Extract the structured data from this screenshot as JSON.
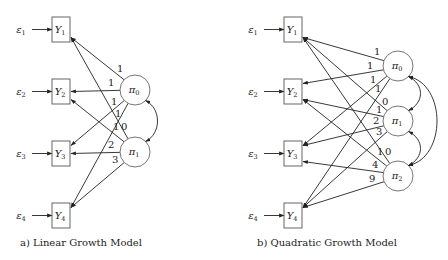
{
  "panels": [
    {
      "id": "linear",
      "caption": "a) Linear Growth Model",
      "caption_pos": [
        20,
        246
      ],
      "observed": [
        {
          "name": "Y",
          "sub": "1",
          "error": "ε",
          "error_sub": "1",
          "x": 52,
          "y": 17
        },
        {
          "name": "Y",
          "sub": "2",
          "error": "ε",
          "error_sub": "2",
          "x": 52,
          "y": 79
        },
        {
          "name": "Y",
          "sub": "3",
          "error": "ε",
          "error_sub": "3",
          "x": 52,
          "y": 141
        },
        {
          "name": "Y",
          "sub": "4",
          "error": "ε",
          "error_sub": "4",
          "x": 52,
          "y": 203
        }
      ],
      "latent": [
        {
          "name": "π",
          "sub": "0",
          "cx": 135,
          "cy": 90
        },
        {
          "name": "π",
          "sub": "1",
          "cx": 135,
          "cy": 152
        }
      ],
      "loadings": [
        {
          "from": 0,
          "to": 0,
          "label": "1",
          "lx": 117,
          "ly": 72
        },
        {
          "from": 0,
          "to": 1,
          "label": "1",
          "lx": 108,
          "ly": 86
        },
        {
          "from": 0,
          "to": 2,
          "label": "1",
          "lx": 111,
          "ly": 105
        },
        {
          "from": 0,
          "to": 3,
          "label": "1",
          "lx": 115,
          "ly": 117
        },
        {
          "from": 1,
          "to": 0,
          "label": "0",
          "lx": 121,
          "ly": 130
        },
        {
          "from": 1,
          "to": 1,
          "label": "1",
          "lx": 113,
          "ly": 130
        },
        {
          "from": 1,
          "to": 2,
          "label": "2",
          "lx": 108,
          "ly": 148
        },
        {
          "from": 1,
          "to": 3,
          "label": "3",
          "lx": 112,
          "ly": 163
        }
      ],
      "covariances": [
        [
          0,
          1
        ]
      ]
    },
    {
      "id": "quadratic",
      "caption": "b) Quadratic Growth Model",
      "caption_pos": [
        257,
        246
      ],
      "observed": [
        {
          "name": "Y",
          "sub": "1",
          "error": "ε",
          "error_sub": "1",
          "x": 284,
          "y": 17
        },
        {
          "name": "Y",
          "sub": "2",
          "error": "ε",
          "error_sub": "2",
          "x": 284,
          "y": 79
        },
        {
          "name": "Y",
          "sub": "3",
          "error": "ε",
          "error_sub": "3",
          "x": 284,
          "y": 141
        },
        {
          "name": "Y",
          "sub": "4",
          "error": "ε",
          "error_sub": "4",
          "x": 284,
          "y": 203
        }
      ],
      "latent": [
        {
          "name": "π",
          "sub": "0",
          "cx": 398,
          "cy": 66
        },
        {
          "name": "π",
          "sub": "1",
          "cx": 398,
          "cy": 121
        },
        {
          "name": "π",
          "sub": "2",
          "cx": 398,
          "cy": 176
        }
      ],
      "loadings": [
        {
          "from": 0,
          "to": 0,
          "label": "1",
          "lx": 374,
          "ly": 55
        },
        {
          "from": 0,
          "to": 1,
          "label": "1",
          "lx": 367,
          "ly": 69
        },
        {
          "from": 0,
          "to": 2,
          "label": "1",
          "lx": 370,
          "ly": 83
        },
        {
          "from": 0,
          "to": 3,
          "label": "1",
          "lx": 375,
          "ly": 92
        },
        {
          "from": 1,
          "to": 0,
          "label": "0",
          "lx": 382,
          "ly": 105
        },
        {
          "from": 1,
          "to": 1,
          "label": "1",
          "lx": 376,
          "ly": 113
        },
        {
          "from": 1,
          "to": 2,
          "label": "2",
          "lx": 373,
          "ly": 124
        },
        {
          "from": 1,
          "to": 3,
          "label": "3",
          "lx": 376,
          "ly": 135
        },
        {
          "from": 2,
          "to": 0,
          "label": "0",
          "lx": 385,
          "ly": 155
        },
        {
          "from": 2,
          "to": 1,
          "label": "1",
          "lx": 377,
          "ly": 155
        },
        {
          "from": 2,
          "to": 2,
          "label": "4",
          "lx": 372,
          "ly": 168
        },
        {
          "from": 2,
          "to": 3,
          "label": "9",
          "lx": 369,
          "ly": 182
        }
      ],
      "covariances": [
        [
          0,
          1
        ],
        [
          1,
          2
        ],
        [
          0,
          2
        ]
      ]
    }
  ]
}
